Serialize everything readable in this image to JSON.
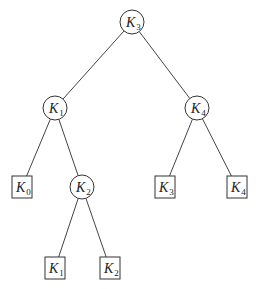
{
  "diagram": {
    "type": "binary-search-tree",
    "nodes": [
      {
        "id": "root",
        "kind": "internal",
        "base": "K",
        "sub": "3"
      },
      {
        "id": "n1",
        "kind": "internal",
        "base": "K",
        "sub": "1"
      },
      {
        "id": "n4",
        "kind": "internal",
        "base": "K",
        "sub": "4"
      },
      {
        "id": "leaf0",
        "kind": "leaf",
        "base": "K",
        "sub": "0"
      },
      {
        "id": "n2",
        "kind": "internal",
        "base": "K",
        "sub": "2"
      },
      {
        "id": "leaf3",
        "kind": "leaf",
        "base": "K",
        "sub": "3"
      },
      {
        "id": "leaf4",
        "kind": "leaf",
        "base": "K",
        "sub": "4"
      },
      {
        "id": "leaf1",
        "kind": "leaf",
        "base": "K",
        "sub": "1"
      },
      {
        "id": "leaf2",
        "kind": "leaf",
        "base": "K",
        "sub": "2"
      }
    ],
    "edges": [
      [
        "root",
        "n1"
      ],
      [
        "root",
        "n4"
      ],
      [
        "n1",
        "leaf0"
      ],
      [
        "n1",
        "n2"
      ],
      [
        "n4",
        "leaf3"
      ],
      [
        "n4",
        "leaf4"
      ],
      [
        "n2",
        "leaf1"
      ],
      [
        "n2",
        "leaf2"
      ]
    ]
  }
}
